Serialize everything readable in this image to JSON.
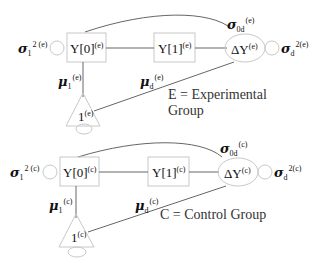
{
  "panels": [
    {
      "id": "experimental",
      "var_left": {
        "symbol": "σ",
        "sub": "1",
        "sup": "2 (e)"
      },
      "y0": {
        "text": "Y[0]",
        "sup": "(e)"
      },
      "y1": {
        "text": "Y[1]",
        "sup": "(e)"
      },
      "dy": {
        "text": "ΔY",
        "sup": "(e)"
      },
      "cov": {
        "symbol": "σ",
        "sub": "0d",
        "sup": "(e)"
      },
      "var_right": {
        "symbol": "σ",
        "sub": "d",
        "sup": "2(e)"
      },
      "mu1": {
        "symbol": "μ",
        "sub": "1",
        "sup": "(e)"
      },
      "mud": {
        "symbol": "μ",
        "sub": "d",
        "sup": "(e)"
      },
      "const": {
        "text": "1",
        "sup": "(e)"
      },
      "caption_lines": [
        "E = Experimental",
        "Group"
      ]
    },
    {
      "id": "control",
      "var_left": {
        "symbol": "σ",
        "sub": "1",
        "sup": "2 (c)"
      },
      "y0": {
        "text": "Y[0]",
        "sup": "(c)"
      },
      "y1": {
        "text": "Y[1]",
        "sup": "(c)"
      },
      "dy": {
        "text": "ΔY",
        "sup": "(c)"
      },
      "cov": {
        "symbol": "σ",
        "sub": "0d",
        "sup": "(c)"
      },
      "var_right": {
        "symbol": "σ",
        "sub": "d",
        "sup": "2(c)"
      },
      "mu1": {
        "symbol": "μ",
        "sub": "1",
        "sup": "(c)"
      },
      "mud": {
        "symbol": "μ",
        "sub": "d",
        "sup": "(c)"
      },
      "const": {
        "text": "1",
        "sup": "(c)"
      },
      "caption_lines": [
        "C = Control Group"
      ]
    }
  ]
}
